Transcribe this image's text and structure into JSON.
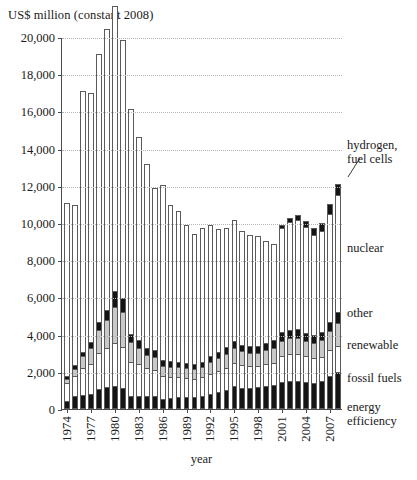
{
  "chart_data": {
    "type": "bar",
    "subtype": "stacked-vertical",
    "title": "",
    "ylabel": "US$ million (constant 2008)",
    "xlabel": "year",
    "ylim": [
      0,
      20000
    ],
    "ytick_values": [
      0,
      2000,
      4000,
      6000,
      8000,
      10000,
      12000,
      14000,
      16000,
      18000,
      20000
    ],
    "ytick_labels": [
      "0",
      "2,000",
      "4,000",
      "6,000",
      "8,000",
      "10,000",
      "12,000",
      "14,000",
      "16,000",
      "18,000",
      "20,000"
    ],
    "grid": "horizontal-dotted",
    "legend_position": "right",
    "categories": [
      "1974",
      "1975",
      "1976",
      "1977",
      "1978",
      "1979",
      "1980",
      "1981",
      "1982",
      "1983",
      "1984",
      "1985",
      "1986",
      "1987",
      "1988",
      "1989",
      "1990",
      "1991",
      "1992",
      "1993",
      "1994",
      "1995",
      "1996",
      "1997",
      "1998",
      "1999",
      "2000",
      "2001",
      "2002",
      "2003",
      "2004",
      "2005",
      "2006",
      "2007",
      "2008"
    ],
    "xtick_labels_shown": [
      "1974",
      "1977",
      "1980",
      "1983",
      "1986",
      "1989",
      "1992",
      "1995",
      "1998",
      "2001",
      "2004",
      "2007"
    ],
    "series": [
      {
        "name": "energy efficiency",
        "color": "#141414",
        "values": [
          420,
          700,
          760,
          800,
          1100,
          1200,
          1250,
          1150,
          720,
          700,
          700,
          700,
          560,
          600,
          640,
          640,
          640,
          700,
          800,
          900,
          1000,
          1250,
          1150,
          1150,
          1200,
          1250,
          1300,
          1450,
          1500,
          1500,
          1450,
          1400,
          1500,
          1800,
          2000
        ]
      },
      {
        "name": "fossil fuels",
        "color": "#ffffff",
        "values": [
          1000,
          1050,
          1450,
          1600,
          1900,
          2100,
          2300,
          2200,
          1800,
          1700,
          1500,
          1400,
          1200,
          1100,
          1100,
          1050,
          1000,
          1000,
          1100,
          1150,
          1200,
          1250,
          1200,
          1150,
          1100,
          1150,
          1200,
          1400,
          1450,
          1450,
          1400,
          1350,
          1300,
          1400,
          1400
        ]
      },
      {
        "name": "renewable",
        "color": "#c9c9c9",
        "values": [
          180,
          420,
          620,
          900,
          1250,
          1500,
          1950,
          1850,
          1100,
          900,
          700,
          700,
          560,
          560,
          520,
          500,
          500,
          550,
          650,
          700,
          750,
          800,
          760,
          720,
          700,
          750,
          780,
          820,
          850,
          880,
          820,
          800,
          900,
          1000,
          1200
        ]
      },
      {
        "name": "other",
        "color": "#141414",
        "values": [
          180,
          220,
          250,
          300,
          450,
          550,
          850,
          750,
          420,
          400,
          380,
          360,
          300,
          300,
          280,
          280,
          280,
          300,
          320,
          340,
          360,
          380,
          360,
          360,
          380,
          400,
          420,
          450,
          450,
          450,
          420,
          420,
          450,
          500,
          600
        ]
      },
      {
        "name": "nuclear",
        "color": "#ffffff",
        "values": [
          9300,
          8600,
          14000,
          13400,
          14400,
          15100,
          15300,
          13900,
          12100,
          10900,
          9900,
          8700,
          9400,
          8400,
          8100,
          7400,
          7000,
          7200,
          7000,
          6600,
          6400,
          6500,
          6100,
          6000,
          5900,
          5500,
          5200,
          5600,
          5800,
          5900,
          5700,
          5400,
          5400,
          5800,
          6300
        ]
      },
      {
        "name": "hydrogen, fuel cells",
        "color": "#141414",
        "values": [
          0,
          0,
          0,
          0,
          0,
          0,
          0,
          0,
          0,
          0,
          0,
          0,
          0,
          0,
          0,
          0,
          0,
          0,
          0,
          0,
          0,
          0,
          0,
          0,
          0,
          0,
          0,
          180,
          200,
          260,
          300,
          380,
          440,
          520,
          580
        ]
      }
    ],
    "totals": [
      11080,
      10990,
      17080,
      17000,
      19100,
      20450,
      21650,
      19850,
      16140,
      14600,
      13180,
      11860,
      12020,
      10960,
      10640,
      9870,
      9420,
      9750,
      9870,
      9690,
      9710,
      10180,
      9570,
      9380,
      9280,
      9050,
      8900,
      9900,
      10250,
      10440,
      10090,
      9750,
      9990,
      11020,
      12080
    ]
  },
  "legend": {
    "items": [
      {
        "key": "hydrogen",
        "label": "hydrogen,\nfuel cells"
      },
      {
        "key": "nuclear",
        "label": "nuclear"
      },
      {
        "key": "other",
        "label": "other"
      },
      {
        "key": "renewable",
        "label": "renewable"
      },
      {
        "key": "fossil_fuels",
        "label": "fossil fuels"
      },
      {
        "key": "energy_efficiency",
        "label": "energy\nefficiency"
      }
    ]
  }
}
